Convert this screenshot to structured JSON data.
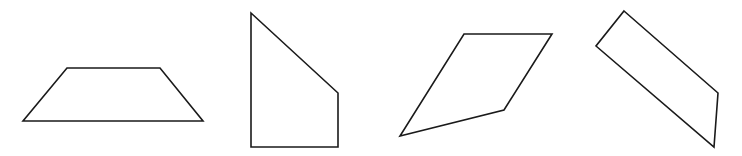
{
  "diagram": {
    "background": "#ffffff",
    "stroke_color": "#1a1a1a",
    "shapes": [
      {
        "name": "trapezoid",
        "points": "67,68 160,68 203,121 23,121"
      },
      {
        "name": "right-trapezoid-quadrilateral",
        "points": "251,13 338,93 338,147 251,147"
      },
      {
        "name": "irregular-quadrilateral",
        "points": "464,34 552,34 504,110 400,136"
      },
      {
        "name": "tilted-quadrilateral",
        "points": "624,11 718,93 714,147 596,46"
      }
    ]
  }
}
